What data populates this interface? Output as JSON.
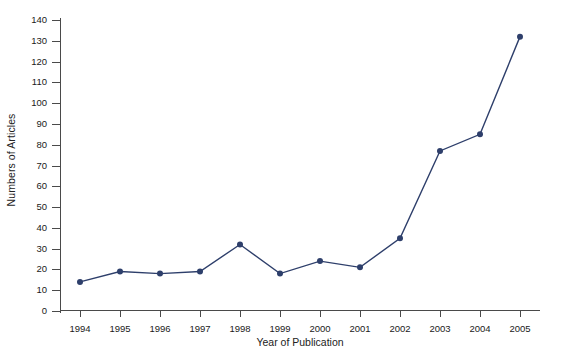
{
  "chart_data": {
    "type": "line",
    "title": "",
    "xlabel": "Year of Publication",
    "ylabel": "Numbers of Articles",
    "categories": [
      "1994",
      "1995",
      "1996",
      "1997",
      "1998",
      "1999",
      "2000",
      "2001",
      "2002",
      "2003",
      "2004",
      "2005"
    ],
    "values": [
      14,
      19,
      18,
      19,
      32,
      18,
      24,
      21,
      35,
      77,
      85,
      132
    ],
    "series": [
      {
        "name": "Numbers of Articles",
        "values": [
          14,
          19,
          18,
          19,
          32,
          18,
          24,
          21,
          35,
          77,
          85,
          132
        ]
      }
    ],
    "ylim": [
      0,
      140
    ],
    "ytick_step": 10,
    "yticks": [
      "140",
      "130",
      "120",
      "110",
      "100",
      "90",
      "80",
      "70",
      "60",
      "50",
      "40",
      "30",
      "20",
      "10",
      "0"
    ],
    "grid": false,
    "legend": "none",
    "marker": "circle",
    "line_color": "#2e3f6b",
    "marker_color": "#2e3f6b",
    "axis_color": "#4a4a4a",
    "background": "#ffffff"
  },
  "figure": {
    "caption_clipped": ""
  }
}
